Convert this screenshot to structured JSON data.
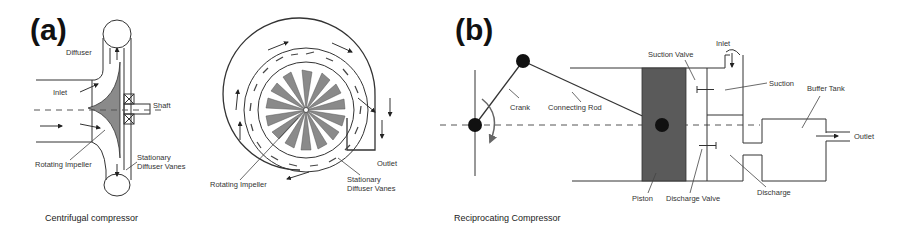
{
  "figure": {
    "panels": [
      {
        "id": "a",
        "label": "(a)",
        "caption": "Centrifugal compressor",
        "side_view_labels": {
          "diffuser": "Diffuser",
          "inlet": "Inlet",
          "shaft": "Shaft",
          "rotating_impeller": "Rotating Impeller",
          "stationary_diffuser_vanes_line1": "Stationary",
          "stationary_diffuser_vanes_line2": "Diffuser Vanes"
        },
        "front_view_labels": {
          "rotating_impeller": "Rotating Impeller",
          "stationary_diffuser_vanes_line1": "Stationary",
          "stationary_diffuser_vanes_line2": "Diffuser Vanes",
          "outlet": "Outlet"
        }
      },
      {
        "id": "b",
        "label": "(b)",
        "caption": "Reciprocating Compressor",
        "labels": {
          "crank": "Crank",
          "connecting_rod": "Connecting Rod",
          "suction_valve": "Suction Valve",
          "inlet": "Inlet",
          "suction": "Suction",
          "buffer_tank": "Buffer Tank",
          "outlet": "Outlet",
          "piston": "Piston",
          "discharge_valve": "Discharge Valve",
          "discharge": "Discharge"
        }
      }
    ],
    "colors": {
      "line": "#333333",
      "impeller_fill": "#8a8a8a",
      "piston_fill": "#5a5a5a",
      "joint_fill": "#111111",
      "background": "#ffffff"
    }
  }
}
